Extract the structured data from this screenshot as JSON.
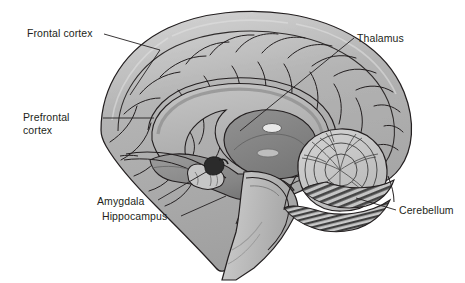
{
  "diagram": {
    "type": "anatomical-illustration",
    "background_color": "#ffffff",
    "line_color": "#231f20",
    "label_text_color": "#231f20",
    "palette": {
      "cortex_fill": "#a9a9a9",
      "cortex_light": "#c3c3c3",
      "cortex_highlight": "#d6d6d6",
      "deep_structure": "#8d8d8d",
      "deep_structure_dark": "#6f6f6f",
      "corpus_callosum": "#b8b8b8",
      "brainstem": "#bdbdbd",
      "cerebellum_fill": "#c9c9c9",
      "cerebellum_stripe": "#4a4a4a",
      "amygdala": "#2b2b2b",
      "hippocampus": "#bfbfbf",
      "ventricle": "#e6e6e6"
    }
  },
  "labels": {
    "frontal_cortex": "Frontal cortex",
    "prefrontal_cortex": "Prefrontal\ncortex",
    "thalamus": "Thalamus",
    "amygdala": "Amygdala",
    "hippocampus": "Hippocampus",
    "cerebellum": "Cerebellum"
  },
  "structures": [
    {
      "name": "frontal-cortex",
      "label": "Frontal cortex"
    },
    {
      "name": "prefrontal-cortex",
      "label": "Prefrontal cortex"
    },
    {
      "name": "thalamus",
      "label": "Thalamus"
    },
    {
      "name": "amygdala",
      "label": "Amygdala"
    },
    {
      "name": "hippocampus",
      "label": "Hippocampus"
    },
    {
      "name": "cerebellum",
      "label": "Cerebellum"
    },
    {
      "name": "corpus-callosum",
      "label": ""
    },
    {
      "name": "brainstem",
      "label": ""
    },
    {
      "name": "cerebral-cortex",
      "label": ""
    }
  ],
  "leader_lines": [
    {
      "name": "leader-frontal-cortex",
      "from": [
        103,
        34
      ],
      "to": [
        155,
        52
      ]
    },
    {
      "name": "leader-prefrontal-cortex",
      "from": [
        102,
        118
      ],
      "to": [
        152,
        118
      ]
    },
    {
      "name": "leader-thalamus",
      "from": [
        354,
        38
      ],
      "to": [
        240,
        131
      ]
    },
    {
      "name": "leader-amygdala",
      "from": [
        158,
        200
      ],
      "to": [
        203,
        174
      ]
    },
    {
      "name": "leader-hippocampus",
      "from": [
        182,
        216
      ],
      "to": [
        222,
        196
      ]
    },
    {
      "name": "leader-cerebellum",
      "from": [
        396,
        210
      ],
      "to": [
        355,
        197
      ]
    }
  ]
}
